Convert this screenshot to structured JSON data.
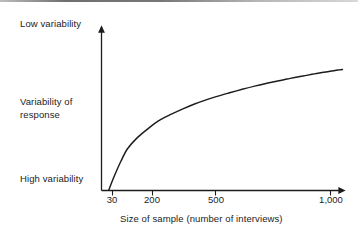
{
  "chart_data": {
    "type": "line",
    "title": "",
    "xlabel": "Size of sample (number of interviews)",
    "ylabel": "Variability of response",
    "x_tick_labels": [
      "30",
      "200",
      "500",
      "1,000"
    ],
    "x_tick_values": [
      30,
      200,
      500,
      1000
    ],
    "y_tick_labels": [
      "Low variability",
      "Variability of response",
      "High variability"
    ],
    "y_axis_annotations": {
      "top": "Low variability",
      "middle_line1": "Variability of",
      "middle_line2": "response",
      "bottom": "High variability"
    },
    "xlim": [
      20,
      1060
    ],
    "ylim": [
      0,
      1
    ],
    "grid": false,
    "legend": false,
    "series": [
      {
        "name": "Variability of response",
        "x": [
          22,
          24,
          27,
          30,
          35,
          42,
          50,
          62,
          75,
          90,
          110,
          130,
          160,
          200,
          250,
          300,
          360,
          420,
          500,
          580,
          660,
          750,
          840,
          930,
          1000,
          1050
        ],
        "y": [
          0.0,
          0.1,
          0.22,
          0.31,
          0.39,
          0.46,
          0.52,
          0.57,
          0.61,
          0.645,
          0.678,
          0.702,
          0.729,
          0.757,
          0.783,
          0.802,
          0.82,
          0.834,
          0.85,
          0.862,
          0.873,
          0.883,
          0.891,
          0.899,
          0.903,
          0.906
        ]
      }
    ],
    "axis_style": {
      "y_axis_arrow": true,
      "x_axis_arrow": true,
      "line_color": "#1c1c1c"
    }
  },
  "labels": {
    "low_variability": "Low variability",
    "variability_of_response_line1": "Variability of",
    "variability_of_response_line2": "response",
    "high_variability": "High variability",
    "x_axis_title": "Size of sample (number of interviews)"
  },
  "ticks": {
    "t0": "30",
    "t1": "200",
    "t2": "500",
    "t3": "1,000"
  }
}
